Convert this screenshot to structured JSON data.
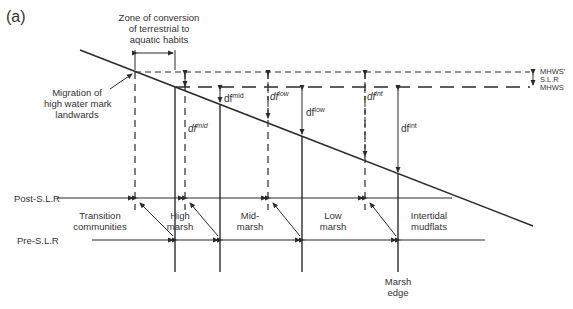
{
  "panel_label": "(a)",
  "top_annotation": {
    "line1": "Zone of conversion",
    "line2": "of terrestrial to",
    "line3": "aquatic habits"
  },
  "migration_annotation": {
    "line1": "Migration of",
    "line2": "high water mark",
    "line3": "landwards"
  },
  "water_levels": {
    "mhws_prime": "MHWS'",
    "slr": "S.L.R",
    "mhws": "MHWS"
  },
  "depth_labels": {
    "df_mid_post": {
      "base": "df",
      "sup": "mid"
    },
    "df_mid_pre": {
      "base": "df",
      "sup": "mid"
    },
    "df_low_post": {
      "base": "df",
      "sup": "low"
    },
    "df_low_pre": {
      "base": "df",
      "sup": "low"
    },
    "df_int_post": {
      "base": "df",
      "sup": "int"
    },
    "df_int_pre": {
      "base": "df",
      "sup": "int"
    }
  },
  "rows": {
    "post_slr": "Post-S.L.R",
    "pre_slr": "Pre-S.L.R"
  },
  "zones": [
    {
      "line1": "Transition",
      "line2": "communities"
    },
    {
      "line1": "High",
      "line2": "marsh"
    },
    {
      "line1": "Mid-",
      "line2": "marsh"
    },
    {
      "line1": "Low",
      "line2": "marsh"
    },
    {
      "line1": "Intertidal",
      "line2": "mudflats"
    }
  ],
  "marsh_edge": {
    "line1": "Marsh",
    "line2": "edge"
  },
  "colors": {
    "line": "#2b2b2b",
    "text": "#333333",
    "background": "#ffffff"
  }
}
